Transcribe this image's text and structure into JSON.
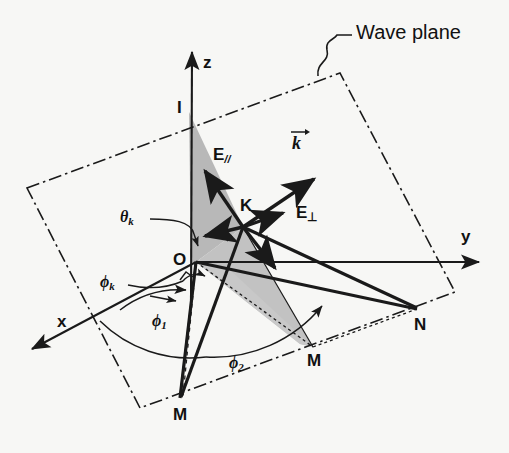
{
  "figure": {
    "title_label": "Wave plane",
    "background": "#f7f7f5",
    "ink_color": "#1a1a1a",
    "shade_color": "#b9b9b9",
    "width": 509,
    "height": 453
  },
  "axes": [
    {
      "name": "z",
      "label": "z",
      "tip": [
        192,
        48
      ],
      "origin": [
        196,
        262
      ]
    },
    {
      "name": "y",
      "label": "y",
      "tip": [
        483,
        262
      ],
      "origin": [
        196,
        262
      ]
    },
    {
      "name": "x",
      "label": "x",
      "tip": [
        27,
        352
      ],
      "origin": [
        196,
        262
      ]
    }
  ],
  "points": [
    {
      "name": "O",
      "label": "O",
      "x": 196,
      "y": 262,
      "desc": "origin"
    },
    {
      "name": "I",
      "label": "I",
      "x": 185,
      "y": 110,
      "desc": "wave-plane z-axis intercept"
    },
    {
      "name": "K",
      "label": "K",
      "x": 243,
      "y": 227,
      "desc": "wave vector foot point"
    },
    {
      "name": "J",
      "label": "J",
      "x": 313,
      "y": 347,
      "desc": "plane trace point"
    },
    {
      "name": "M",
      "label": "M",
      "x": 180,
      "y": 398,
      "desc": "lower plane vertex"
    },
    {
      "name": "N",
      "label": "N",
      "x": 418,
      "y": 310,
      "desc": "right plane vertex"
    }
  ],
  "vectors": [
    {
      "name": "E-parallel",
      "label": "E",
      "subscript": "//",
      "from": [
        243,
        227
      ],
      "to": [
        204,
        168
      ]
    },
    {
      "name": "k-wave-vector",
      "label": "k",
      "subscript": "",
      "from": [
        243,
        227
      ],
      "to": [
        318,
        176
      ]
    },
    {
      "name": "E-perpendicular",
      "label": "E",
      "subscript": "⊥",
      "from": [
        243,
        227
      ],
      "to": [
        288,
        210
      ]
    }
  ],
  "angles": [
    {
      "name": "theta-k",
      "label": "θ",
      "subscript": "k",
      "label_x": 122,
      "label_y": 216
    },
    {
      "name": "phi-k",
      "label": "ϕ",
      "subscript": "k",
      "label_x": 103,
      "label_y": 281
    },
    {
      "name": "phi-1",
      "label": "ϕ",
      "subscript": "1",
      "label_x": 156,
      "label_y": 320
    },
    {
      "name": "phi-2",
      "label": "ϕ",
      "subscript": "2",
      "label_x": 232,
      "label_y": 363
    }
  ],
  "wave_plane": {
    "corners": [
      [
        27,
        188
      ],
      [
        340,
        73
      ],
      [
        455,
        292
      ],
      [
        140,
        408
      ]
    ],
    "line_style": "dash-dot",
    "label": "Wave plane"
  },
  "shaded_regions": [
    {
      "name": "plane-of-incidence-upper",
      "fill": "#b9b9b9"
    },
    {
      "name": "plane-of-incidence-lower",
      "fill": "#c6c6c6"
    }
  ],
  "ghost_text": [
    {
      "text": "scissors-shears",
      "x": 44,
      "y": 104
    },
    {
      "text": "scattering wave",
      "x": 66,
      "y": 168
    }
  ]
}
